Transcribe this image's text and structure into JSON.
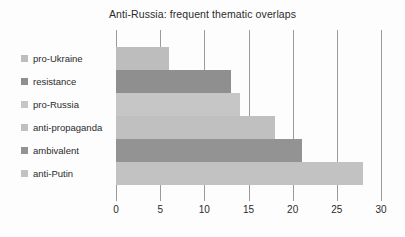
{
  "chart_data": {
    "type": "bar",
    "orientation": "horizontal",
    "title": "Anti-Russia: frequent thematic overlaps",
    "xlabel": "",
    "ylabel": "",
    "categories": [
      "pro-Ukraine",
      "resistance",
      "pro-Russia",
      "anti-propaganda",
      "ambivalent",
      "anti-Putin"
    ],
    "values": [
      6,
      13,
      14,
      18,
      21,
      28
    ],
    "xlim": [
      0,
      30
    ],
    "xticks": [
      0,
      5,
      10,
      15,
      20,
      25,
      30
    ],
    "xtick_labels": [
      "0",
      "5",
      "10",
      "15",
      "20",
      "25",
      "30"
    ],
    "grid": true,
    "grid_axis": "x",
    "legend_position": "left",
    "bar_colors": [
      "#bdbdbd",
      "#8f8f8f",
      "#c6c6c6",
      "#c0c0c0",
      "#939393",
      "#c2c2c2"
    ],
    "grid_color": "#9a9a9a",
    "background_color": "#fdfdfd",
    "series": [
      {
        "name": "frequent thematic overlaps",
        "points": [
          {
            "category": "pro-Ukraine",
            "value": 6,
            "color": "#bdbdbd"
          },
          {
            "category": "resistance",
            "value": 13,
            "color": "#8f8f8f"
          },
          {
            "category": "pro-Russia",
            "value": 14,
            "color": "#c6c6c6"
          },
          {
            "category": "anti-propaganda",
            "value": 18,
            "color": "#c0c0c0"
          },
          {
            "category": "ambivalent",
            "value": 21,
            "color": "#939393"
          },
          {
            "category": "anti-Putin",
            "value": 28,
            "color": "#c2c2c2"
          }
        ]
      }
    ]
  },
  "legend": {
    "items": [
      {
        "label": "pro-Ukraine",
        "color": "#bdbdbd"
      },
      {
        "label": "resistance",
        "color": "#8f8f8f"
      },
      {
        "label": "pro-Russia",
        "color": "#c6c6c6"
      },
      {
        "label": "anti-propaganda",
        "color": "#c0c0c0"
      },
      {
        "label": "ambivalent",
        "color": "#939393"
      },
      {
        "label": "anti-Putin",
        "color": "#c2c2c2"
      }
    ]
  }
}
